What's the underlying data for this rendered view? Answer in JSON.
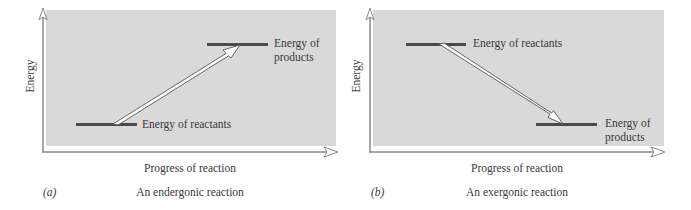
{
  "figure": {
    "panels": [
      {
        "id": "a",
        "tag": "(a)",
        "caption": "An endergonic reaction",
        "y_axis_label": "Energy",
        "x_axis_label": "Progress of reaction",
        "reactants_label": "Energy of reactants",
        "products_label_line1": "Energy of",
        "products_label_line2": "products",
        "direction": "uphill"
      },
      {
        "id": "b",
        "tag": "(b)",
        "caption": "An exergonic reaction",
        "y_axis_label": "Energy",
        "x_axis_label": "Progress of reaction",
        "reactants_label": "Energy of reactants",
        "products_label_line1": "Energy of",
        "products_label_line2": "products",
        "direction": "downhill"
      }
    ],
    "colors": {
      "plot_background": "#d9d9d9",
      "level_line": "#4a4a4a",
      "axis": "#8a8a8a",
      "arrow_fill": "#ffffff",
      "arrow_stroke": "#555555"
    }
  }
}
